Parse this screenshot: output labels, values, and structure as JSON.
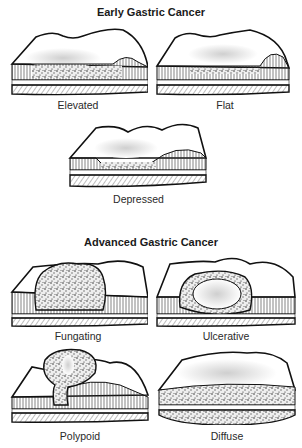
{
  "sections": [
    {
      "title": "Early Gastric Cancer",
      "panels": [
        {
          "label": "Elevated",
          "type": "elevated"
        },
        {
          "label": "Flat",
          "type": "flat"
        },
        {
          "label": "Depressed",
          "type": "depressed"
        }
      ]
    },
    {
      "title": "Advanced Gastric Cancer",
      "panels": [
        {
          "label": "Fungating",
          "type": "fungating"
        },
        {
          "label": "Ulcerative",
          "type": "ulcerative"
        },
        {
          "label": "Polypoid",
          "type": "polypoid"
        },
        {
          "label": "Diffuse",
          "type": "diffuse"
        }
      ]
    }
  ],
  "colors": {
    "ink": "#111111",
    "stipple": "#bbbbbb",
    "background": "#ffffff"
  }
}
